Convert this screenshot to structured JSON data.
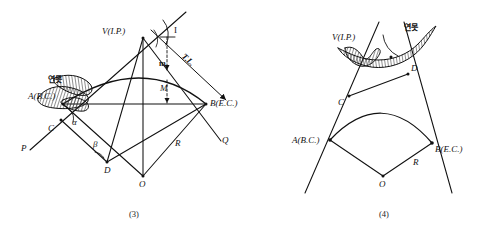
{
  "figure": {
    "title_note": "Curve setting around a pond (연못) — I.P. inaccessible",
    "panels": [
      {
        "id": "panel-3",
        "caption": "(3)",
        "obstacle_label": "연못",
        "labels": [
          {
            "key": "v",
            "text": "V(I.P.)"
          },
          {
            "key": "a",
            "text": "A(B.C.)"
          },
          {
            "key": "b",
            "text": "B(E.C.)"
          },
          {
            "key": "c",
            "text": "C"
          },
          {
            "key": "d",
            "text": "D"
          },
          {
            "key": "o",
            "text": "O"
          },
          {
            "key": "p",
            "text": "P"
          },
          {
            "key": "q",
            "text": "Q"
          },
          {
            "key": "r",
            "text": "R"
          },
          {
            "key": "m_lower",
            "text": "m"
          },
          {
            "key": "m_upper",
            "text": "M"
          },
          {
            "key": "i_angle",
            "text": "I"
          },
          {
            "key": "tangent",
            "text": "T.L."
          },
          {
            "key": "alpha",
            "text": "α"
          },
          {
            "key": "beta",
            "text": "β"
          }
        ]
      },
      {
        "id": "panel-4",
        "caption": "(4)",
        "obstacle_label": "연못",
        "labels": [
          {
            "key": "v",
            "text": "V(I.P.)"
          },
          {
            "key": "a",
            "text": "A(B.C.)"
          },
          {
            "key": "b",
            "text": "B(E.C.)"
          },
          {
            "key": "c",
            "text": "C"
          },
          {
            "key": "d",
            "text": "D"
          },
          {
            "key": "o",
            "text": "O"
          },
          {
            "key": "r",
            "text": "R"
          }
        ]
      }
    ]
  },
  "colors": {
    "ink": "#111111",
    "paper": "#ffffff",
    "hatch": "#333333"
  }
}
